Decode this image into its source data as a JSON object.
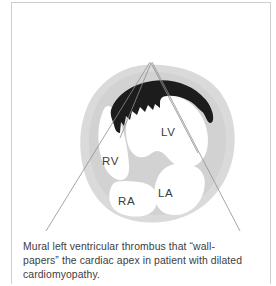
{
  "figure": {
    "caption_line_1": "Mural left ventricular thrombus that “wall-",
    "caption_line_2": "papers” the cardiac apex in patient with dilated",
    "caption_line_3": "cardiomyopathy.",
    "caption_full": "Mural left ventricular thrombus that “wall-papers” the cardiac apex in patient with dilated cardiomyopathy."
  },
  "diagram": {
    "type": "medical-illustration",
    "view": "apical four-chamber",
    "labels": [
      {
        "id": "lv",
        "text": "LV",
        "meaning": "left ventricle",
        "x": 149,
        "y": 128
      },
      {
        "id": "rv",
        "text": "RV",
        "meaning": "right ventricle",
        "x": 101,
        "y": 158
      },
      {
        "id": "ra",
        "text": "RA",
        "meaning": "right atrium",
        "x": 117,
        "y": 198
      },
      {
        "id": "la",
        "text": "LA",
        "meaning": "left atrium",
        "x": 157,
        "y": 190
      }
    ],
    "findings": [
      {
        "id": "thrombus",
        "name": "mural thrombus",
        "location": "left ventricular apex",
        "shading": "dark"
      }
    ],
    "sector": {
      "name": "ultrasound sector lines",
      "apex_x": 150,
      "apex_y": 62,
      "left_end_x": 46,
      "left_end_y": 231,
      "right_end_x": 240,
      "right_end_y": 231
    }
  },
  "colors": {
    "myocardium": "#d6d6d6",
    "myocardium_outer": "#dcdcdc",
    "chamber": "#ffffff",
    "thrombus": "#1c1c1c",
    "sector_line": "#8e8e8e",
    "label_text": "#3b3b3b",
    "caption_text": "#3d3d3d",
    "frame": "#cfcfcf",
    "background": "#ffffff"
  }
}
